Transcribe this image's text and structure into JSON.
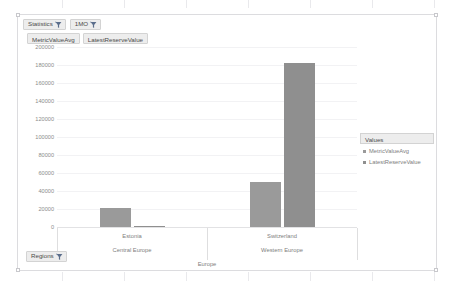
{
  "slicers": {
    "items": [
      {
        "label": "Statistics",
        "icon": "filter-icon"
      },
      {
        "label": "1MO",
        "icon": "filter-icon"
      }
    ],
    "region": {
      "label": "Regions",
      "icon": "filter-icon"
    }
  },
  "value_fields": [
    {
      "label": "MetricValueAvg"
    },
    {
      "label": "LatestReserveValue"
    }
  ],
  "legend": {
    "title": "Values",
    "items": [
      {
        "label": "MetricValueAvg",
        "color": "#9a9a9a"
      },
      {
        "label": "LatestReserveValue",
        "color": "#8f8f8f"
      }
    ]
  },
  "chart_data": {
    "type": "bar",
    "title": "",
    "xlabel": "Europe",
    "ylabel": "",
    "categories": [
      "Estonia",
      "Switzerland"
    ],
    "group_labels": [
      "Central Europe",
      "Western Europe"
    ],
    "axis_root_label": "Europe",
    "series": [
      {
        "name": "MetricValueAvg",
        "color": "#9a9a9a",
        "values": [
          21000,
          50000
        ]
      },
      {
        "name": "LatestReserveValue",
        "color": "#8f8f8f",
        "values": [
          300,
          182000
        ]
      }
    ],
    "ylim": [
      0,
      200000
    ],
    "ytick_values": [
      200000,
      180000,
      160000,
      140000,
      120000,
      100000,
      80000,
      60000,
      40000,
      20000,
      0
    ],
    "ytick_labels": [
      "200000",
      "180000",
      "160000",
      "140000",
      "120000",
      "100000",
      "80000",
      "60000",
      "40000",
      "20000",
      "0"
    ],
    "grid": true,
    "legend_position": "right"
  }
}
